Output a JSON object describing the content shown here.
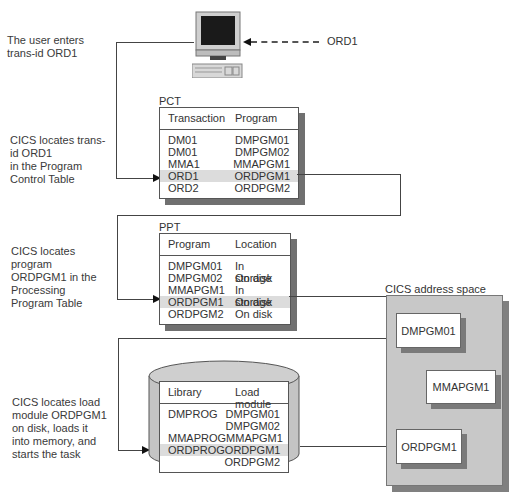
{
  "steps": [
    {
      "text_lines": [
        "The user enters",
        "trans-id ORD1"
      ]
    },
    {
      "text_lines": [
        "CICS locates trans-",
        "id ORD1",
        "in the Program",
        "Control Table"
      ]
    },
    {
      "text_lines": [
        "CICS locates",
        "program",
        "ORDPGM1 in the",
        "Processing",
        "Program Table"
      ]
    },
    {
      "text_lines": [
        "CICS locates load",
        "module ORDPGM1",
        "on disk, loads it",
        "into memory, and",
        "starts the task"
      ]
    }
  ],
  "terminal": {
    "input_label": "ORD1"
  },
  "pct": {
    "title": "PCT",
    "headers": [
      "Transaction",
      "Program"
    ],
    "rows": [
      [
        "DM01",
        "DMPGM01"
      ],
      [
        "DM01",
        "DMPGM02"
      ],
      [
        "MMA1",
        "MMAPGM1"
      ],
      [
        "ORD1",
        "ORDPGM1"
      ],
      [
        "ORD2",
        "ORDPGM2"
      ]
    ],
    "highlight_row": 3
  },
  "ppt": {
    "title": "PPT",
    "headers": [
      "Program",
      "Location"
    ],
    "rows": [
      [
        "DMPGM01",
        "In storage"
      ],
      [
        "DMPGM02",
        "On disk"
      ],
      [
        "MMAPGM1",
        "In storage"
      ],
      [
        "ORDPGM1",
        "On disk"
      ],
      [
        "ORDPGM2",
        "On disk"
      ]
    ],
    "highlight_row": 3
  },
  "library": {
    "headers": [
      "Library",
      "Load module"
    ],
    "rows": [
      [
        "DMPROG",
        "DMPGM01"
      ],
      [
        "",
        "DMPGM02"
      ],
      [
        "MMAPROG",
        "MMAPGM1"
      ],
      [
        "ORDPROG",
        "ORDPGM1"
      ],
      [
        "",
        "ORDPGM2"
      ]
    ],
    "highlight_row": 3
  },
  "address_space": {
    "title": "CICS address space",
    "programs": [
      "DMPGM01",
      "MMAPGM1",
      "ORDPGM1"
    ]
  },
  "colors": {
    "highlight": "#dcdcdc",
    "shadow": "#707070",
    "address_space_fill": "#c8c8c8"
  }
}
